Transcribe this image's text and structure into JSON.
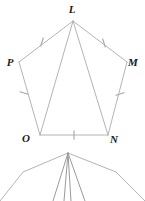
{
  "figure": {
    "stroke_color": "#b4b4b4",
    "tick_color": "#a8a8a8",
    "label_color": "#1a1a1a",
    "background": "#ffffff",
    "vertices": [
      {
        "name": "L",
        "label": "L",
        "x": 73,
        "y": 21,
        "label_x": 72,
        "label_y": 13
      },
      {
        "name": "M",
        "label": "M",
        "x": 127,
        "y": 62,
        "label_x": 133,
        "label_y": 66
      },
      {
        "name": "N",
        "label": "N",
        "x": 108,
        "y": 135,
        "label_x": 114,
        "label_y": 143
      },
      {
        "name": "O",
        "label": "O",
        "x": 40,
        "y": 135,
        "label_x": 26,
        "label_y": 142
      },
      {
        "name": "P",
        "label": "P",
        "x": 19,
        "y": 62,
        "label_x": 10,
        "label_y": 66
      }
    ],
    "sides": [
      {
        "name": "side-LM",
        "from": "L",
        "to": "M",
        "ticks": 1
      },
      {
        "name": "side-MN",
        "from": "M",
        "to": "N",
        "ticks": 1
      },
      {
        "name": "side-NO",
        "from": "N",
        "to": "O",
        "ticks": 1
      },
      {
        "name": "side-OP",
        "from": "O",
        "to": "P",
        "ticks": 1
      },
      {
        "name": "side-PL",
        "from": "P",
        "to": "L",
        "ticks": 1
      }
    ],
    "diagonals": [
      {
        "name": "diagonal-LO",
        "from": "L",
        "to": "O"
      },
      {
        "name": "diagonal-LN",
        "from": "L",
        "to": "N"
      }
    ],
    "tick_marks": [
      {
        "name": "tick-PL",
        "x": 42,
        "y": 42,
        "angle": 18
      },
      {
        "name": "tick-LM",
        "x": 104,
        "y": 43,
        "angle": -18
      },
      {
        "name": "tick-MN",
        "x": 120,
        "y": 94,
        "angle": 72
      },
      {
        "name": "tick-OP",
        "x": 24,
        "y": 93,
        "angle": -72
      },
      {
        "name": "tick-NO",
        "x": 74,
        "y": 135,
        "angle": 0
      }
    ]
  },
  "partial_figure": {
    "name": "partial-second-diagram",
    "apex": {
      "x": 68,
      "y": 153
    },
    "outer_rays": [
      {
        "name": "ray-left-outer",
        "bend_x": 23,
        "bend_y": 172,
        "end_x": 0,
        "end_y": 201
      },
      {
        "name": "ray-right-outer",
        "bend_x": 116,
        "bend_y": 172,
        "end_x": 145,
        "end_y": 201
      }
    ],
    "inner_rays": [
      {
        "name": "ray-inner-1",
        "end_x": 53,
        "end_y": 201
      },
      {
        "name": "ray-inner-2",
        "end_x": 64,
        "end_y": 201
      },
      {
        "name": "ray-inner-3",
        "end_x": 71,
        "end_y": 201
      },
      {
        "name": "ray-inner-4",
        "end_x": 85,
        "end_y": 201
      }
    ]
  }
}
